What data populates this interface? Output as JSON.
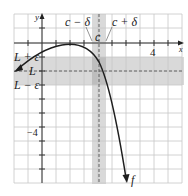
{
  "diagram": {
    "labels": {
      "y_axis": "y",
      "x_axis": "x",
      "c_minus_delta": "c − δ",
      "c_plus_delta": "c + δ",
      "c": "c",
      "L_plus_eps": "L + ε",
      "L": "L",
      "L_minus_eps": "L − ε",
      "x_tick_4": "4",
      "y_tick_neg4": "−4",
      "function": "f"
    },
    "colors": {
      "grid": "#c8c8c8",
      "band": "#d4d4d4",
      "band_dark": "#b4b4b4",
      "axis": "#333333",
      "curve": "#222222"
    }
  }
}
